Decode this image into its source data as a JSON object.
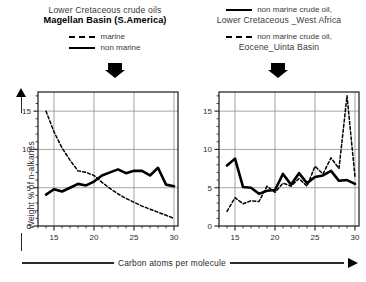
{
  "figure": {
    "left_panel": {
      "title_line1": "Lower Cretaceous crude oils",
      "title_line2": "Magellan Basin (S.America)",
      "legend": [
        {
          "style": "dashed",
          "label": "marine"
        },
        {
          "style": "solid",
          "label": "non marine"
        }
      ],
      "arrow_icon": "down-arrow-icon"
    },
    "right_panel": {
      "legend_top": {
        "style": "solid",
        "label": "non marine crude oil,"
      },
      "title_top": "Lower Cretaceous _West Africa",
      "legend_bottom": {
        "style": "dashed",
        "label": "non marine crude oil,"
      },
      "title_bottom": "Eocene_Uinta Basin",
      "arrow_icon": "down-arrow-icon"
    },
    "axis_labels": {
      "y": "Weight % of n-alkanes",
      "x": "Carbon atoms per molecule"
    }
  },
  "chart_data": [
    {
      "id": "magellan-basin",
      "type": "line",
      "title": "Lower Cretaceous crude oils Magellan Basin (S.America)",
      "xlabel": "Carbon atoms per molecule",
      "ylabel": "Weight % of n-alkanes",
      "xlim": [
        13,
        30.5
      ],
      "ylim": [
        0,
        17.5
      ],
      "xticks": [
        15,
        20,
        25,
        30
      ],
      "yticks": [
        0,
        5,
        10,
        15
      ],
      "grid": true,
      "legend_position": "above-plot",
      "series": [
        {
          "name": "marine",
          "style": "dashed",
          "x": [
            14,
            15,
            16,
            17,
            18,
            19,
            20,
            21,
            22,
            23,
            24,
            25,
            26,
            27,
            28,
            29,
            30
          ],
          "values": [
            15.0,
            12.3,
            10.2,
            8.6,
            7.2,
            7.0,
            6.6,
            5.7,
            4.9,
            4.2,
            3.6,
            3.1,
            2.6,
            2.2,
            1.8,
            1.4,
            1.0
          ]
        },
        {
          "name": "non marine",
          "style": "solid",
          "x": [
            14,
            15,
            16,
            17,
            18,
            19,
            20,
            21,
            22,
            23,
            24,
            25,
            26,
            27,
            28,
            29,
            30
          ],
          "values": [
            4.1,
            4.8,
            4.5,
            5.0,
            5.5,
            5.3,
            5.8,
            6.6,
            7.0,
            7.4,
            6.9,
            7.2,
            7.2,
            6.6,
            7.6,
            5.4,
            5.2
          ]
        }
      ]
    },
    {
      "id": "west-africa-uinta",
      "type": "line",
      "title": "non marine crude oil, Lower Cretaceous _West Africa / Eocene_Uinta Basin",
      "xlabel": "Carbon atoms per molecule",
      "ylabel": "Weight % of n-alkanes",
      "xlim": [
        13,
        30.5
      ],
      "ylim": [
        0,
        17.5
      ],
      "xticks": [
        15,
        20,
        25,
        30
      ],
      "yticks": [
        0,
        5,
        10,
        15
      ],
      "grid": true,
      "legend_position": "above-plot",
      "series": [
        {
          "name": "non marine crude oil, Lower Cretaceous _West Africa",
          "style": "solid",
          "x": [
            14,
            15,
            16,
            17,
            18,
            19,
            20,
            21,
            22,
            23,
            24,
            25,
            26,
            27,
            28,
            29,
            30
          ],
          "values": [
            7.9,
            8.8,
            5.1,
            5.0,
            4.2,
            4.6,
            4.7,
            6.8,
            5.4,
            6.9,
            5.6,
            6.4,
            6.6,
            7.2,
            5.9,
            6.0,
            5.5
          ]
        },
        {
          "name": "non marine crude oil, Eocene_Uinta Basin",
          "style": "dashed",
          "x": [
            14,
            15,
            16,
            17,
            18,
            19,
            20,
            21,
            22,
            23,
            24,
            25,
            26,
            27,
            28,
            29,
            30
          ],
          "values": [
            1.9,
            3.7,
            2.9,
            3.3,
            3.2,
            5.2,
            4.4,
            5.6,
            5.2,
            6.2,
            5.2,
            7.8,
            6.8,
            8.9,
            7.5,
            17.0,
            6.4
          ]
        }
      ]
    }
  ]
}
